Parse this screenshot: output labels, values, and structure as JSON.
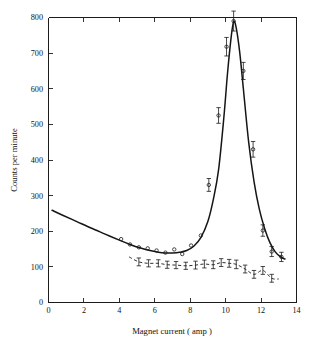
{
  "figure": {
    "background_color": "#ffffff",
    "ink_color": "#161616"
  },
  "chart_data": {
    "type": "line",
    "title": "",
    "subtitle": "",
    "xlabel": "Magnet current ( amp )",
    "ylabel": "Counts per minute",
    "xlim": [
      0,
      14
    ],
    "ylim": [
      0,
      800
    ],
    "xticks": [
      0,
      2,
      4,
      6,
      8,
      10,
      12,
      14
    ],
    "xticklabels": [
      "0",
      "2",
      "4",
      "6",
      "8",
      "10",
      "12",
      "14"
    ],
    "yticks": [
      0,
      100,
      200,
      300,
      400,
      500,
      600,
      700,
      800
    ],
    "yticklabels": [
      "0",
      "100",
      "200",
      "300",
      "400",
      "500",
      "600",
      "700",
      "800"
    ],
    "grid": false,
    "legend": null,
    "annotations": [],
    "series": [
      {
        "name": "total counts",
        "style": "solid",
        "marker": "open-circle",
        "linewidth": 1.5,
        "curve_x": [
          0.2,
          0.8,
          1.6,
          2.4,
          3.2,
          4.0,
          4.6,
          5.2,
          5.8,
          6.2,
          6.6,
          7.0,
          7.4,
          7.8,
          8.2,
          8.6,
          9.0,
          9.3,
          9.6,
          9.9,
          10.1,
          10.3,
          10.45,
          10.6,
          10.8,
          11.0,
          11.3,
          11.6,
          11.9,
          12.2,
          12.5,
          12.8,
          13.1,
          13.35
        ],
        "curve_y": [
          259,
          245,
          227,
          209,
          192,
          175,
          163,
          153,
          145,
          141,
          139,
          139,
          141,
          146,
          158,
          182,
          228,
          288,
          372,
          520,
          640,
          740,
          788,
          770,
          700,
          600,
          450,
          340,
          262,
          208,
          168,
          142,
          128,
          122
        ],
        "points": [
          {
            "x": 4.1,
            "y": 178,
            "err": 0
          },
          {
            "x": 4.6,
            "y": 163,
            "err": 0
          },
          {
            "x": 5.1,
            "y": 155,
            "err": 0
          },
          {
            "x": 5.6,
            "y": 152,
            "err": 0
          },
          {
            "x": 6.1,
            "y": 146,
            "err": 0
          },
          {
            "x": 6.6,
            "y": 140,
            "err": 0
          },
          {
            "x": 7.1,
            "y": 149,
            "err": 0
          },
          {
            "x": 7.55,
            "y": 136,
            "err": 0
          },
          {
            "x": 8.05,
            "y": 160,
            "err": 0
          },
          {
            "x": 8.6,
            "y": 188,
            "err": 0
          },
          {
            "x": 9.05,
            "y": 330,
            "err": 18
          },
          {
            "x": 9.6,
            "y": 525,
            "err": 22
          },
          {
            "x": 10.05,
            "y": 718,
            "err": 26
          },
          {
            "x": 10.45,
            "y": 790,
            "err": 28
          },
          {
            "x": 11.0,
            "y": 650,
            "err": 24
          },
          {
            "x": 11.55,
            "y": 430,
            "err": 22
          },
          {
            "x": 12.1,
            "y": 202,
            "err": 16
          },
          {
            "x": 12.6,
            "y": 143,
            "err": 14
          },
          {
            "x": 13.15,
            "y": 128,
            "err": 13
          }
        ]
      },
      {
        "name": "background counts",
        "style": "dashed",
        "marker": "error-bar",
        "linewidth": 0.95,
        "curve_x": [
          4.55,
          5.1,
          5.65,
          6.2,
          6.7,
          7.2,
          7.75,
          8.3,
          8.8,
          9.3,
          9.75,
          10.2,
          10.6,
          11.1,
          11.6,
          12.1,
          12.6,
          13.0
        ],
        "curve_y": [
          128,
          114,
          110,
          110,
          106,
          105,
          103,
          105,
          108,
          106,
          112,
          110,
          107,
          94,
          79,
          90,
          68,
          66
        ],
        "points": [
          {
            "x": 5.1,
            "y": 114,
            "err": 11
          },
          {
            "x": 5.65,
            "y": 110,
            "err": 10
          },
          {
            "x": 6.2,
            "y": 110,
            "err": 10
          },
          {
            "x": 6.7,
            "y": 106,
            "err": 10
          },
          {
            "x": 7.2,
            "y": 105,
            "err": 10
          },
          {
            "x": 7.75,
            "y": 103,
            "err": 10
          },
          {
            "x": 8.3,
            "y": 105,
            "err": 11
          },
          {
            "x": 8.8,
            "y": 108,
            "err": 11
          },
          {
            "x": 9.3,
            "y": 106,
            "err": 11
          },
          {
            "x": 9.75,
            "y": 112,
            "err": 11
          },
          {
            "x": 10.2,
            "y": 110,
            "err": 11
          },
          {
            "x": 10.6,
            "y": 107,
            "err": 12
          },
          {
            "x": 11.1,
            "y": 94,
            "err": 11
          },
          {
            "x": 11.6,
            "y": 79,
            "err": 11
          },
          {
            "x": 12.1,
            "y": 90,
            "err": 11
          },
          {
            "x": 12.6,
            "y": 68,
            "err": 11
          }
        ]
      }
    ]
  }
}
